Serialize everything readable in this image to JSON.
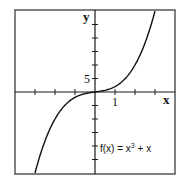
{
  "chart_data": {
    "type": "line",
    "title": "",
    "xlabel": "x",
    "ylabel": "y",
    "function": "f(x) = x^3 + x",
    "annotation": "f(x) = x³ + x",
    "xlim": [
      -4,
      4
    ],
    "ylim": [
      -30.4,
      30.4
    ],
    "x_tick_step": 1,
    "y_tick_step": 5,
    "x_ticks": [
      -3,
      -2,
      -1,
      1,
      2,
      3
    ],
    "y_ticks": [
      -25,
      -20,
      -15,
      -10,
      -5,
      5,
      10,
      15,
      20,
      25
    ],
    "tick_labels": {
      "x": [
        {
          "value": 1,
          "label": "1"
        }
      ],
      "y": [
        {
          "value": 5,
          "label": "5"
        }
      ]
    },
    "grid": false,
    "legend": null,
    "series": [
      {
        "name": "f(x) = x³ + x",
        "x": [
          -3,
          -2.5,
          -2,
          -1.5,
          -1,
          -0.5,
          0,
          0.5,
          1,
          1.5,
          2,
          2.5,
          3
        ],
        "y": [
          -30,
          -18.125,
          -10,
          -4.875,
          -2,
          -0.625,
          0,
          0.625,
          2,
          4.875,
          10,
          18.125,
          30
        ]
      }
    ]
  },
  "labels": {
    "x_axis": "x",
    "y_axis": "y",
    "x_tick_1": "1",
    "y_tick_5": "5",
    "function_prefix": "f(x) = x",
    "function_exp": "3",
    "function_suffix": " + x"
  }
}
